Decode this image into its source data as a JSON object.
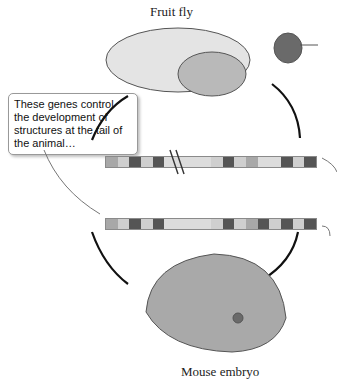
{
  "figure": {
    "organisms": {
      "top_label": "Fruit fly",
      "bottom_label": "Mouse embryo"
    },
    "callout": {
      "text": "These genes control the development of structures at the tail of the animal…"
    },
    "color_note": "Screenshot is grayscale; all segment colors are approximate lightness levels, not true hues.",
    "palette": {
      "light": "#cfcfcf",
      "lighter": "#dcdcdc",
      "medium": "#a8a8a8",
      "dark": "#555555"
    },
    "fly_bar": {
      "has_break_mark": true,
      "segments": [
        "medium",
        "light",
        "dark",
        "light",
        "dark",
        "lighter",
        "lighter",
        "lighter",
        "lighter",
        "light",
        "dark",
        "light",
        "medium",
        "lighter",
        "lighter",
        "dark",
        "light",
        "dark"
      ]
    },
    "mouse_bar": {
      "has_break_mark": false,
      "segments": [
        "medium",
        "light",
        "dark",
        "light",
        "dark",
        "lighter",
        "lighter",
        "lighter",
        "lighter",
        "light",
        "dark",
        "light",
        "medium",
        "dark",
        "light",
        "dark",
        "light",
        "dark"
      ]
    }
  }
}
